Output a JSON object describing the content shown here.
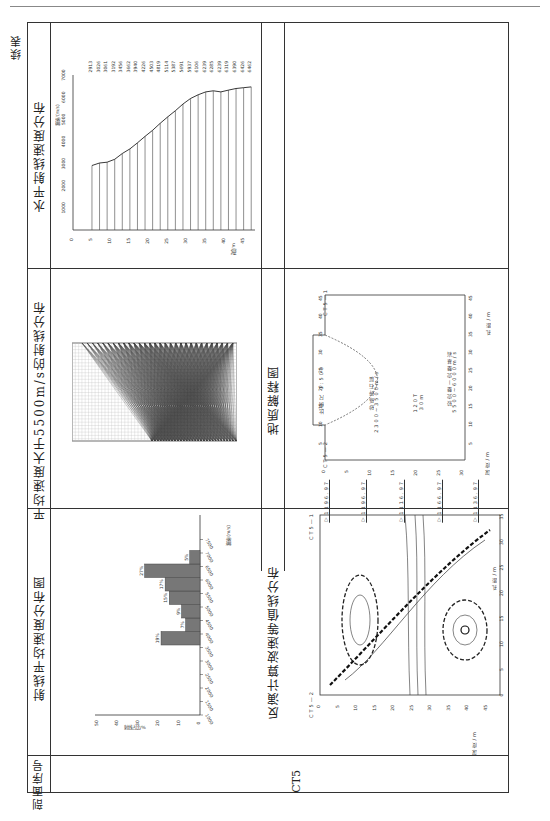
{
  "page": {
    "running_header": "",
    "continued_label": "续表"
  },
  "table": {
    "row_header_label": "剖面序号",
    "section_id": "CT5",
    "cells": {
      "horizontal_velocity_title": "水平射线速度分布",
      "ray_distribution_title": "平均速度大于5500m/s的射线分布",
      "geological_title": "地质解释图",
      "histogram_title": "射线平均速度分布图",
      "contour_title": "反演计算波速等值线分布"
    }
  },
  "geology": {
    "scale_label": "比例尺  1:500",
    "layer1_name": "砂砾碎石层",
    "layer1_velocity": "2300~3500m/s",
    "layer2_name": "较完整—完整基岩",
    "layer2_velocity": "5500~6000m/s",
    "boundary_note_top": "120T",
    "boundary_note_bottom": "30m",
    "hole_left": "CT5—2",
    "hole_right": "CT5—1",
    "depth_axis_label": "深度/m",
    "distance_axis_label": "孔距/m",
    "water_levels": [
      "▽1196.97",
      "▽1196.97",
      "▽1116.97",
      "▽1166.97",
      "▽1136.97"
    ]
  },
  "contour": {
    "hole_left": "CT5—2",
    "hole_right": "CT5—1",
    "depth_axis_label": "深度/m",
    "distance_axis_label": "孔距/m"
  },
  "chart_data": [
    {
      "type": "line",
      "title": "水平射线速度分布",
      "xlabel": "深度/m",
      "ylabel": "波速/(m/s)",
      "x": [
        5,
        7,
        9,
        11,
        13,
        15,
        17,
        19,
        21,
        23,
        25,
        27,
        29,
        31,
        33,
        35,
        37,
        39,
        41,
        43,
        45,
        47
      ],
      "values": [
        2913,
        3026,
        3061,
        3192,
        3456,
        3662,
        3940,
        4226,
        4503,
        4819,
        5114,
        5387,
        5691,
        5937,
        6106,
        6239,
        6285,
        6239,
        6319,
        6390,
        6426,
        6462
      ],
      "xticks": [
        0,
        5,
        10,
        15,
        20,
        25,
        30,
        35,
        40,
        45
      ],
      "yticks": [
        1000,
        2000,
        3000,
        4000,
        5000,
        6000,
        7000
      ],
      "ylim": [
        0,
        7000
      ],
      "grid": false
    },
    {
      "type": "bar",
      "title": "射线平均速度分布图",
      "xlabel": "波速/(m/s)",
      "ylabel": "射线占比/%",
      "categories": [
        "4000-4500",
        "4500-5000",
        "5000-5500",
        "5500-6000",
        "6000-6500",
        "6500-7000",
        "7000-7500"
      ],
      "values": [
        19,
        7,
        9,
        15,
        17,
        27,
        5
      ],
      "value_labels": [
        "19%",
        "7%",
        "9%",
        "15%",
        "17%",
        "27%",
        "5%"
      ],
      "xticks": [
        1000,
        1500,
        2000,
        2500,
        3000,
        3500,
        4000,
        4500,
        5000,
        5500,
        6000,
        6500,
        7000,
        7500
      ],
      "yticks": [
        0,
        10,
        20,
        30,
        40,
        50
      ],
      "ylim": [
        0,
        50
      ]
    }
  ]
}
